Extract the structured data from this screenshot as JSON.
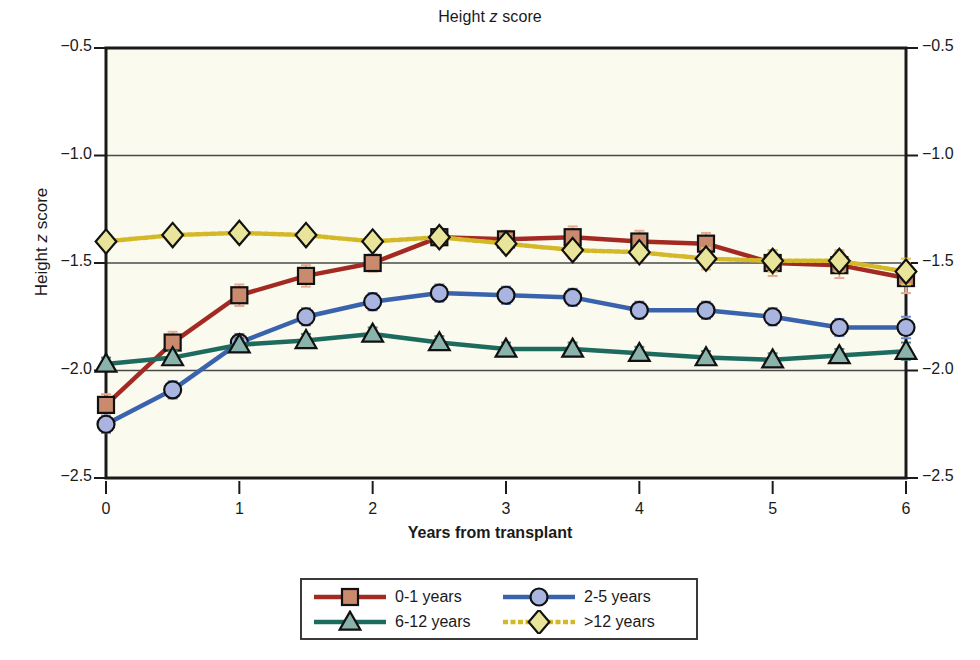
{
  "chart_data": {
    "type": "line",
    "title_plain": "Height z score",
    "xlabel": "Years from transplant",
    "ylabel": "Height z score",
    "xlim": [
      0,
      6
    ],
    "ylim": [
      -2.5,
      -0.5
    ],
    "xticks": [
      "0",
      "1",
      "2",
      "3",
      "4",
      "5",
      "6"
    ],
    "xtick_values": [
      0,
      1,
      2,
      3,
      4,
      5,
      6
    ],
    "yticks": [
      "−0.5",
      "−1.0",
      "−1.5",
      "−2.0",
      "−2.5"
    ],
    "ytick_values": [
      -0.5,
      -1.0,
      -1.5,
      -2.0,
      -2.5
    ],
    "grid": "horizontal",
    "right_axis_mirrored": true,
    "legend_position": "below-center",
    "x": [
      0,
      0.5,
      1,
      1.5,
      2,
      2.5,
      3,
      3.5,
      4,
      4.5,
      5,
      5.5,
      6
    ],
    "series": [
      {
        "name": "0-1 years",
        "marker": "square",
        "line_color": "#a32a22",
        "marker_fill": "#c98a6e",
        "values": [
          -2.16,
          -1.87,
          -1.65,
          -1.56,
          -1.5,
          -1.38,
          -1.39,
          -1.38,
          -1.4,
          -1.41,
          -1.5,
          -1.51,
          -1.57
        ],
        "errors": [
          0.05,
          0.05,
          0.05,
          0.05,
          0.04,
          0.04,
          0.04,
          0.05,
          0.05,
          0.05,
          0.06,
          0.06,
          0.07
        ]
      },
      {
        "name": "2-5 years",
        "marker": "circle",
        "line_color": "#3a63ad",
        "marker_fill": "#a9b4e0",
        "values": [
          -2.25,
          -2.09,
          -1.87,
          -1.75,
          -1.68,
          -1.64,
          -1.65,
          -1.66,
          -1.72,
          -1.72,
          -1.75,
          -1.8,
          -1.8
        ],
        "errors": [
          0.04,
          0.04,
          0.04,
          0.04,
          0.04,
          0.04,
          0.04,
          0.04,
          0.04,
          0.04,
          0.04,
          0.04,
          0.05
        ]
      },
      {
        "name": "6-12 years",
        "marker": "triangle",
        "line_color": "#1d6b5e",
        "marker_fill": "#8ab3ab",
        "values": [
          -1.97,
          -1.94,
          -1.88,
          -1.86,
          -1.83,
          -1.87,
          -1.9,
          -1.9,
          -1.92,
          -1.94,
          -1.95,
          -1.93,
          -1.91
        ],
        "errors": [
          0.03,
          0.03,
          0.03,
          0.03,
          0.03,
          0.03,
          0.03,
          0.03,
          0.03,
          0.03,
          0.03,
          0.03,
          0.04
        ]
      },
      {
        "name": ">12 years",
        "marker": "diamond",
        "line_color": "#d4b827",
        "marker_fill": "#e8e49a",
        "values": [
          -1.4,
          -1.37,
          -1.36,
          -1.37,
          -1.4,
          -1.38,
          -1.41,
          -1.44,
          -1.45,
          -1.48,
          -1.49,
          -1.49,
          -1.54
        ],
        "errors": [
          0.03,
          0.03,
          0.03,
          0.03,
          0.03,
          0.03,
          0.04,
          0.04,
          0.04,
          0.05,
          0.05,
          0.05,
          0.06
        ]
      }
    ]
  },
  "legend": {
    "items": [
      {
        "label": "0-1 years",
        "marker": "square",
        "line_color": "#a32a22",
        "marker_fill": "#c98a6e",
        "dashed": false
      },
      {
        "label": "2-5 years",
        "marker": "circle",
        "line_color": "#3a63ad",
        "marker_fill": "#a9b4e0",
        "dashed": false
      },
      {
        "label": "6-12 years",
        "marker": "triangle",
        "line_color": "#1d6b5e",
        "marker_fill": "#8ab3ab",
        "dashed": false
      },
      {
        "label": ">12 years",
        "marker": "diamond",
        "line_color": "#d4b827",
        "marker_fill": "#e8e49a",
        "dashed": true
      }
    ]
  },
  "colors": {
    "plot_background": "#fbfaef",
    "axis": "#1a1a1a",
    "grid": "#4a4a4a",
    "page_background": "#ffffff"
  }
}
